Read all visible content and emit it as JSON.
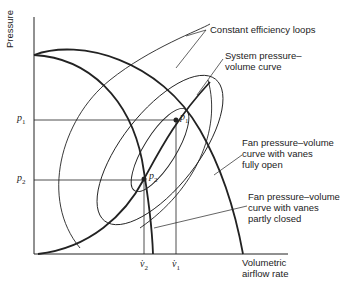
{
  "diagram": {
    "axes": {
      "y_label": "Pressure",
      "x_label_line1": "Volumetric",
      "x_label_line2": "airflow rate"
    },
    "ticks": {
      "p1": {
        "base": "p",
        "sub": "1"
      },
      "p2": {
        "base": "p",
        "sub": "2"
      },
      "v1": {
        "base": "v̇",
        "sub": "1"
      },
      "v2": {
        "base": "v̇",
        "sub": "2"
      }
    },
    "points": {
      "p1": {
        "base": "p",
        "sub": "1"
      },
      "p2": {
        "base": "p",
        "sub": "2"
      }
    },
    "annotations": {
      "efficiency": "Constant efficiency loops",
      "system_line1": "System pressure–",
      "system_line2": "volume curve",
      "fan_open_line1": "Fan pressure–volume",
      "fan_open_line2": "curve with vanes",
      "fan_open_line3": "fully open",
      "fan_closed_line1": "Fan pressure–volume",
      "fan_closed_line2": "curve with vanes",
      "fan_closed_line3": "partly closed"
    },
    "colors": {
      "ink": "#222222",
      "background": "#ffffff"
    }
  }
}
